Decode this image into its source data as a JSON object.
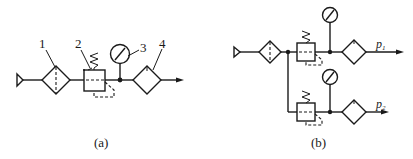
{
  "diagrams": {
    "a": {
      "caption": "(a)",
      "callouts": [
        "1",
        "2",
        "3",
        "4"
      ],
      "components": [
        {
          "id": "1",
          "type": "air-filter"
        },
        {
          "id": "2",
          "type": "pressure-regulator"
        },
        {
          "id": "3",
          "type": "pressure-gauge"
        },
        {
          "id": "4",
          "type": "lubricator"
        }
      ]
    },
    "b": {
      "caption": "(b)",
      "outputs": [
        {
          "symbol": "p",
          "subscript": "1"
        },
        {
          "symbol": "p",
          "subscript": "2"
        }
      ]
    }
  },
  "colors": {
    "line": "#1a1a1a",
    "background": "#ffffff"
  }
}
